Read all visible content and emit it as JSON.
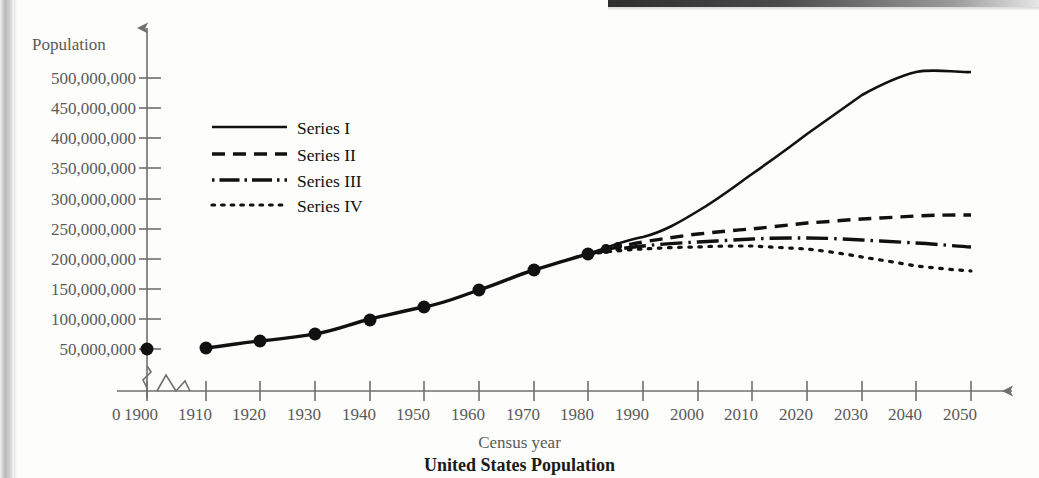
{
  "chart_data": {
    "type": "line",
    "title": "United States Population",
    "xlabel": "Census year",
    "ylabel": "Population",
    "grid": false,
    "legend_position": "upper-left-inside",
    "axis_break_x": true,
    "axis_break_y": true,
    "origin_label": "0",
    "xlim": [
      1890,
      2055
    ],
    "ylim": [
      0,
      520000000
    ],
    "xticks": [
      "1900",
      "1910",
      "1920",
      "1930",
      "1940",
      "1950",
      "1960",
      "1970",
      "1980",
      "1990",
      "2000",
      "2010",
      "2020",
      "2030",
      "2040",
      "2050"
    ],
    "yticks": [
      "50,000,000",
      "100,000,000",
      "150,000,000",
      "200,000,000",
      "250,000,000",
      "300,000,000",
      "350,000,000",
      "400,000,000",
      "450,000,000",
      "500,000,000"
    ],
    "ytick_values": [
      50000000,
      100000000,
      150000000,
      200000000,
      250000000,
      300000000,
      350000000,
      400000000,
      450000000,
      500000000
    ],
    "historical": {
      "name": "Historical census (markers)",
      "x": [
        1900,
        1910,
        1920,
        1930,
        1940,
        1950,
        1960,
        1970,
        1980
      ],
      "values": [
        76000000,
        92000000,
        106000000,
        123000000,
        132000000,
        151000000,
        179000000,
        203000000,
        227000000
      ]
    },
    "series": [
      {
        "name": "Series I",
        "style": "solid",
        "x": [
          1980,
          1990,
          2000,
          2010,
          2020,
          2030,
          2040,
          2050
        ],
        "values": [
          227000000,
          255000000,
          290000000,
          330000000,
          375000000,
          420000000,
          465000000,
          505000000
        ]
      },
      {
        "name": "Series II",
        "style": "dashed",
        "x": [
          1980,
          1990,
          2000,
          2010,
          2020,
          2030,
          2040,
          2050
        ],
        "values": [
          227000000,
          247000000,
          260000000,
          268000000,
          277000000,
          283000000,
          287000000,
          288000000
        ]
      },
      {
        "name": "Series III",
        "style": "dash-dot",
        "x": [
          1980,
          1990,
          2000,
          2010,
          2020,
          2030,
          2040,
          2050
        ],
        "values": [
          227000000,
          241000000,
          247000000,
          251000000,
          253000000,
          252000000,
          248000000,
          242000000
        ]
      },
      {
        "name": "Series IV",
        "style": "dotted",
        "x": [
          1980,
          1990,
          2000,
          2010,
          2020,
          2030,
          2040,
          2050
        ],
        "values": [
          227000000,
          235000000,
          238000000,
          239000000,
          237000000,
          231000000,
          220000000,
          205000000
        ]
      }
    ]
  },
  "legend": {
    "items": [
      {
        "label": "Series I",
        "style": "solid"
      },
      {
        "label": "Series II",
        "style": "dashed"
      },
      {
        "label": "Series III",
        "style": "dash-dot"
      },
      {
        "label": "Series IV",
        "style": "dotted"
      }
    ]
  }
}
